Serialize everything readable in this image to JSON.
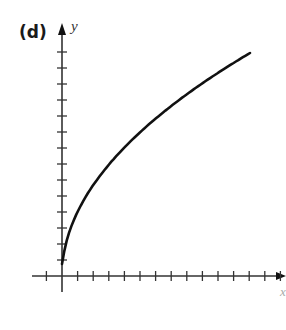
{
  "chart_data": {
    "type": "line",
    "title": "",
    "panel_label": "(d)",
    "xlabel": "x",
    "ylabel": "y",
    "function": "y = sqrt(x) (scaled)",
    "x_ticks": {
      "negative": 1,
      "positive": 14,
      "labels": []
    },
    "y_ticks": {
      "negative": 0,
      "positive": 14,
      "labels": []
    },
    "grid": false,
    "legend": null,
    "series": [
      {
        "name": "curve",
        "x": [
          0,
          0.25,
          1,
          2,
          3,
          4,
          5,
          6,
          7,
          8,
          9,
          10,
          11,
          12
        ],
        "y": [
          0,
          1.8,
          3.6,
          5.1,
          6.2,
          7.2,
          8.1,
          8.8,
          9.5,
          10.2,
          10.8,
          11.4,
          12.0,
          12.5
        ]
      }
    ],
    "xlim": [
      -2,
      14.3
    ],
    "ylim": [
      -1,
      16
    ]
  },
  "colors": {
    "axis": "#333333",
    "curve": "#111111",
    "background": "#ffffff"
  }
}
